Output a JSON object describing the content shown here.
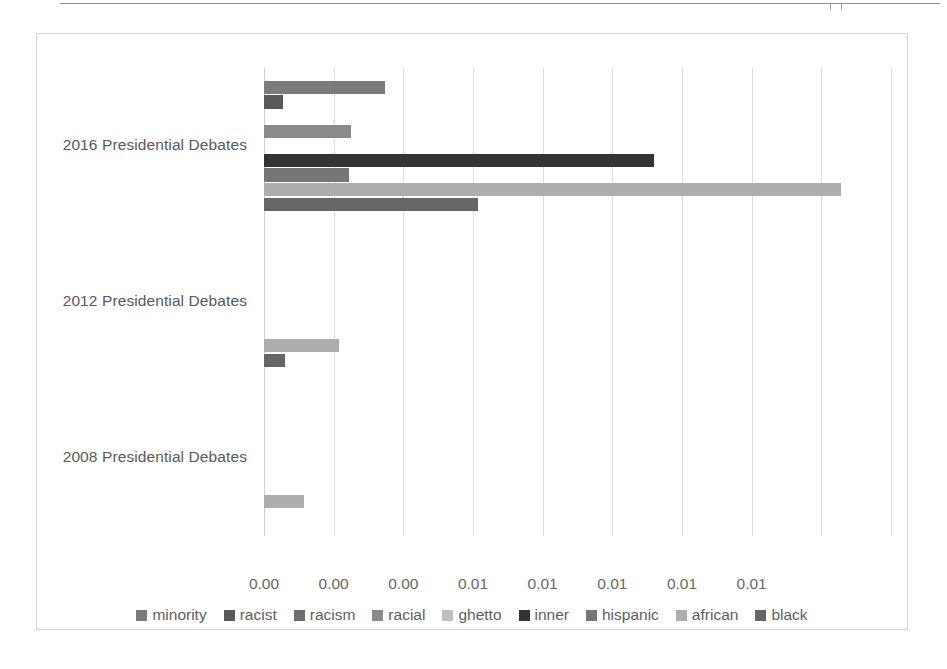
{
  "chart_data": {
    "type": "bar",
    "orientation": "horizontal",
    "title": "",
    "subtitle": "",
    "xlabel": "",
    "ylabel": "",
    "grid": true,
    "legend_position": "bottom",
    "categories": [
      "2016 Presidential Debates",
      "2012 Presidential Debates",
      "2008 Presidential Debates"
    ],
    "xlim": [
      0,
      0.0126
    ],
    "xticks": [
      0,
      0.0014,
      0.0028,
      0.0042,
      0.0056,
      0.007,
      0.0084,
      0.0098,
      0.0112,
      0.0126
    ],
    "xtick_labels": [
      "0.00",
      "0.00",
      "0.00",
      "0.01",
      "0.01",
      "0.01",
      "0.01",
      "0.01",
      "",
      ""
    ],
    "series": [
      {
        "name": "minority",
        "color": "#7b7b7b",
        "values": [
          0.00243,
          0.0,
          0.0
        ]
      },
      {
        "name": "racist",
        "color": "#595959",
        "values": [
          0.00039,
          0.0,
          0.0
        ]
      },
      {
        "name": "racism",
        "color": "#6e6e6e",
        "values": [
          0.0,
          0.0,
          0.0
        ]
      },
      {
        "name": "racial",
        "color": "#8a8a8a",
        "values": [
          0.00175,
          0.0,
          0.0
        ]
      },
      {
        "name": "ghetto",
        "color": "#bfbfbf",
        "values": [
          0.0,
          0.0,
          0.0
        ]
      },
      {
        "name": "inner",
        "color": "#333333",
        "values": [
          0.00783,
          0.0,
          0.0
        ]
      },
      {
        "name": "hispanic",
        "color": "#767676",
        "values": [
          0.0017,
          0.0,
          0.0
        ]
      },
      {
        "name": "african",
        "color": "#adadad",
        "values": [
          0.0116,
          0.00151,
          0.00081
        ]
      },
      {
        "name": "black",
        "color": "#666666",
        "values": [
          0.0043,
          0.00043,
          0.0
        ]
      }
    ]
  },
  "axis": {
    "category_labels": [
      "2016 Presidential Debates",
      "2012 Presidential Debates",
      "2008 Presidential Debates"
    ],
    "x_tick_labels": [
      "0.00",
      "0.00",
      "0.00",
      "0.01",
      "0.01",
      "0.01",
      "0.01",
      "0.01"
    ]
  },
  "legend": {
    "items": [
      {
        "label": "minority",
        "color": "#7b7b7b"
      },
      {
        "label": "racist",
        "color": "#595959"
      },
      {
        "label": "racism",
        "color": "#6e6e6e"
      },
      {
        "label": "racial",
        "color": "#8a8a8a"
      },
      {
        "label": "ghetto",
        "color": "#bfbfbf"
      },
      {
        "label": "inner",
        "color": "#333333"
      },
      {
        "label": "hispanic",
        "color": "#767676"
      },
      {
        "label": "african",
        "color": "#adadad"
      },
      {
        "label": "black",
        "color": "#666666"
      }
    ]
  }
}
